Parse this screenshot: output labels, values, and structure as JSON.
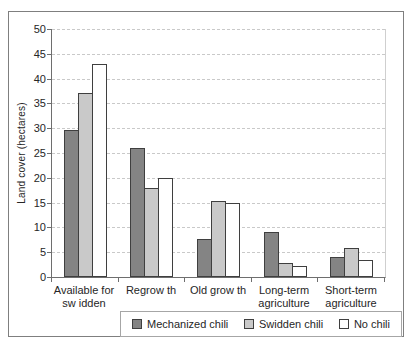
{
  "chart_data": {
    "type": "bar",
    "title": "",
    "xlabel": "",
    "ylabel": "Land cover (hectares)",
    "ylim": [
      0,
      50
    ],
    "ytick_step": 5,
    "yticks": [
      0,
      5,
      10,
      15,
      20,
      25,
      30,
      35,
      40,
      45,
      50
    ],
    "grid": "horizontal-dashed",
    "legend_position": "bottom",
    "categories": [
      "Available for sw idden",
      "Regrow th",
      "Old grow th",
      "Long-term agriculture",
      "Short-term agriculture"
    ],
    "category_lines": [
      [
        "Available for",
        "sw idden"
      ],
      [
        "Regrow th"
      ],
      [
        "Old grow th"
      ],
      [
        "Long-term",
        "agriculture"
      ],
      [
        "Short-term",
        "agriculture"
      ]
    ],
    "series": [
      {
        "name": "Mechanized chili",
        "color": "#848484",
        "values": [
          29.7,
          26,
          7.7,
          9,
          4.1
        ]
      },
      {
        "name": "Swidden chili",
        "color": "#c9c9c9",
        "values": [
          37,
          18,
          15.3,
          2.8,
          5.8
        ]
      },
      {
        "name": "No chili",
        "color": "#ffffff",
        "values": [
          43,
          20,
          15,
          2.3,
          3.5
        ]
      }
    ]
  },
  "colors": {
    "background": "#ffffff",
    "text": "#262626",
    "bar_border": "#3f3f3f",
    "gridline": "#c9c9c9",
    "axis": "#6e6e6e",
    "chart_border": "#7f7f7f",
    "plot_border": "#cfcfcf",
    "legend_border": "#a6a6a6"
  }
}
